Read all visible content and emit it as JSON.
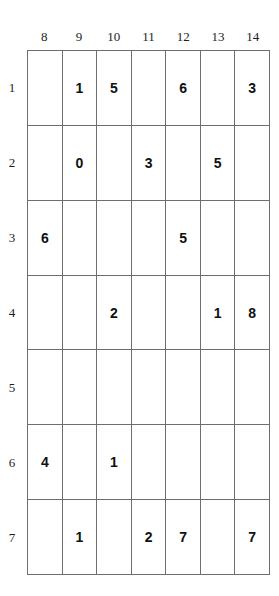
{
  "grid": {
    "column_headers": [
      "8",
      "9",
      "10",
      "11",
      "12",
      "13",
      "14"
    ],
    "row_headers": [
      "1",
      "2",
      "3",
      "4",
      "5",
      "6",
      "7"
    ],
    "rows": [
      [
        "",
        "1",
        "5",
        "",
        "6",
        "",
        "3"
      ],
      [
        "",
        "0",
        "",
        "3",
        "",
        "5",
        ""
      ],
      [
        "6",
        "",
        "",
        "",
        "5",
        "",
        ""
      ],
      [
        "",
        "",
        "2",
        "",
        "",
        "1",
        "8"
      ],
      [
        "",
        "",
        "",
        "",
        "",
        "",
        ""
      ],
      [
        "4",
        "",
        "1",
        "",
        "",
        "",
        ""
      ],
      [
        "",
        "1",
        "",
        "2",
        "7",
        "",
        "7"
      ]
    ],
    "colors": {
      "grid_line": "#6e6e6e",
      "cell_text": "#111111",
      "header_text": "#1d1d1d",
      "background": "#ffffff"
    }
  }
}
